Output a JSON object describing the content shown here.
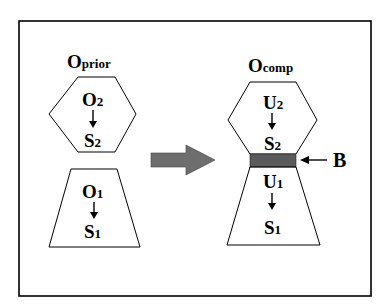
{
  "left": {
    "title_main": "O",
    "title_sub": "prior",
    "hexagon": {
      "top_main": "O",
      "top_sub": "2",
      "bottom_main": "S",
      "bottom_sub": "2"
    },
    "trapezoid": {
      "top_main": "O",
      "top_sub": "1",
      "bottom_main": "S",
      "bottom_sub": "1"
    }
  },
  "right": {
    "title_main": "O",
    "title_sub": "comp",
    "hexagon": {
      "top_main": "U",
      "top_sub": "2",
      "bottom_main": "S",
      "bottom_sub": "2"
    },
    "trapezoid": {
      "top_main": "U",
      "top_sub": "1",
      "bottom_main": "S",
      "bottom_sub": "1"
    },
    "boundary_label": "B"
  },
  "colors": {
    "arrow_fill": "#6e6e6e",
    "band_fill": "#5a5a5a",
    "stroke": "#000000"
  }
}
